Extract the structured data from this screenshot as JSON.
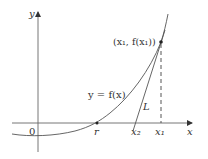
{
  "diagram": {
    "axes": {
      "x_label": "x",
      "y_label": "y",
      "origin_label": "0"
    },
    "curve": {
      "label": "y = f(x)"
    },
    "point": {
      "label": "(x₁, f(x₁))"
    },
    "tangent": {
      "label": "L"
    },
    "x_ticks": {
      "root": "r",
      "x2": "x₂",
      "x1": "x₁"
    },
    "colors": {
      "axis": "#444444",
      "curve": "#555555",
      "text": "#333333",
      "background": "#ffffff"
    }
  }
}
